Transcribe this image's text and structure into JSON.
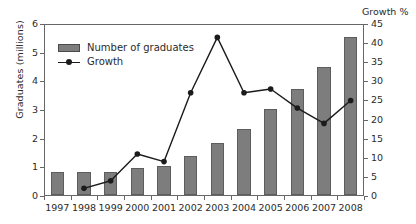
{
  "chart_data": {
    "type": "bar",
    "title": "",
    "subtitle": "",
    "xlabel": "",
    "ylabel": "Graduates (millions)",
    "y2label": "Growth %",
    "grid": false,
    "legend_position": "top-left",
    "categories": [
      "1997",
      "1998",
      "1999",
      "2000",
      "2001",
      "2002",
      "2003",
      "2004",
      "2005",
      "2006",
      "2007",
      "2008"
    ],
    "ylim": [
      0,
      6
    ],
    "yticks": [
      0,
      1,
      2,
      3,
      4,
      5,
      6
    ],
    "y2lim": [
      0,
      45
    ],
    "y2ticks": [
      0,
      5,
      10,
      15,
      20,
      25,
      30,
      35,
      40,
      45
    ],
    "series": [
      {
        "name": "Number of graduates",
        "kind": "bar",
        "axis": "left",
        "unit": "millions",
        "color": "#7d7d7d",
        "values": [
          0.82,
          0.82,
          0.82,
          0.93,
          1.02,
          1.35,
          1.82,
          2.3,
          3.0,
          3.7,
          4.45,
          5.5
        ]
      },
      {
        "name": "Growth",
        "kind": "line",
        "axis": "right",
        "unit": "%",
        "color": "#1b1b1b",
        "values": [
          null,
          2,
          4,
          11,
          9,
          27,
          41.5,
          27,
          28,
          23,
          19,
          25
        ]
      }
    ]
  },
  "legend": {
    "entries": [
      {
        "label": "Number of graduates",
        "marker": "bar-swatch-icon"
      },
      {
        "label": "Growth",
        "marker": "line-marker-icon"
      }
    ]
  }
}
